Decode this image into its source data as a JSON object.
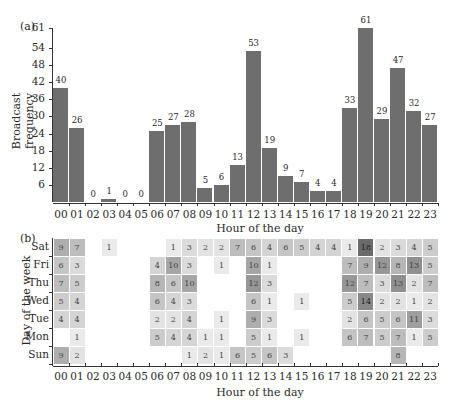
{
  "chart_data": [
    {
      "type": "bar",
      "panel_label": "(a)",
      "title": "",
      "xlabel": "Hour of the day",
      "ylabel": "Broadcast frequency",
      "ylim": [
        0,
        61
      ],
      "yticks": [
        6,
        12,
        18,
        24,
        30,
        36,
        42,
        48,
        54,
        61
      ],
      "grid": false,
      "bar_color": "#6e6e6e",
      "categories": [
        "00",
        "01",
        "02",
        "03",
        "04",
        "05",
        "06",
        "07",
        "08",
        "09",
        "10",
        "11",
        "12",
        "13",
        "14",
        "15",
        "16",
        "17",
        "18",
        "19",
        "20",
        "21",
        "22",
        "23"
      ],
      "values": [
        40,
        26,
        0,
        1,
        0,
        0,
        25,
        27,
        28,
        5,
        6,
        13,
        53,
        19,
        9,
        7,
        4,
        4,
        33,
        61,
        29,
        47,
        32,
        27
      ]
    },
    {
      "type": "heatmap",
      "panel_label": "(b)",
      "xlabel": "Hour of the day",
      "ylabel": "Day of the week",
      "x": [
        "00",
        "01",
        "02",
        "03",
        "04",
        "05",
        "06",
        "07",
        "08",
        "09",
        "10",
        "11",
        "12",
        "13",
        "14",
        "15",
        "16",
        "17",
        "18",
        "19",
        "20",
        "21",
        "22",
        "23"
      ],
      "y": [
        "Sat",
        "Fri",
        "Thu",
        "Wed",
        "Tue",
        "Mon",
        "Sun"
      ],
      "max_value": 18,
      "color_low": "#f2f2f2",
      "color_high": "#6a6a6a",
      "values": [
        [
          9,
          7,
          null,
          1,
          null,
          null,
          null,
          1,
          3,
          2,
          2,
          7,
          6,
          4,
          6,
          5,
          4,
          4,
          1,
          18,
          2,
          3,
          4,
          5
        ],
        [
          6,
          3,
          null,
          null,
          null,
          null,
          4,
          10,
          3,
          null,
          1,
          null,
          10,
          1,
          null,
          null,
          null,
          null,
          7,
          9,
          12,
          8,
          13,
          5
        ],
        [
          7,
          5,
          null,
          null,
          null,
          null,
          8,
          6,
          10,
          null,
          null,
          null,
          12,
          3,
          null,
          null,
          null,
          null,
          12,
          7,
          3,
          13,
          2,
          7
        ],
        [
          5,
          4,
          null,
          null,
          null,
          null,
          6,
          4,
          3,
          null,
          null,
          null,
          6,
          1,
          null,
          1,
          null,
          null,
          5,
          14,
          2,
          2,
          1,
          2
        ],
        [
          4,
          4,
          null,
          null,
          null,
          null,
          2,
          2,
          4,
          null,
          1,
          null,
          9,
          3,
          null,
          null,
          null,
          null,
          2,
          6,
          5,
          6,
          11,
          3
        ],
        [
          null,
          1,
          null,
          null,
          null,
          null,
          5,
          4,
          4,
          1,
          1,
          null,
          5,
          1,
          null,
          1,
          null,
          null,
          6,
          7,
          5,
          7,
          1,
          5
        ],
        [
          9,
          2,
          null,
          null,
          null,
          null,
          null,
          null,
          1,
          2,
          1,
          6,
          5,
          6,
          3,
          null,
          null,
          null,
          null,
          null,
          null,
          8,
          null,
          null
        ]
      ]
    }
  ]
}
